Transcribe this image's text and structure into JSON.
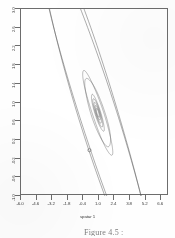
{
  "figure": {
    "caption": "Figure 4.5 :"
  },
  "chart_data": {
    "type": "line",
    "title": "",
    "subtitle": "",
    "xlabel": "spatar 1",
    "ylabel": "",
    "xlim": [
      -6.0,
      7.3
    ],
    "ylim": [
      -1.0,
      3.0
    ],
    "grid": false,
    "legend": null,
    "xticks": [
      "-6.0",
      "-4.6",
      "-3.2",
      "-1.8",
      "-0.4",
      "1.0",
      "2.4",
      "3.8",
      "5.2",
      "6.6"
    ],
    "xtick_values": [
      -6.0,
      -4.6,
      -3.2,
      -1.8,
      -0.4,
      1.0,
      2.4,
      3.8,
      5.2,
      6.6
    ],
    "yticks": [
      "3.0",
      "2.6",
      "2.2",
      "1.8",
      "1.4",
      "1.0",
      "0.6",
      "0.2",
      "-0.2",
      "-0.6",
      "-1.0"
    ],
    "ytick_values": [
      3.0,
      2.6,
      2.2,
      1.8,
      1.4,
      1.0,
      0.6,
      0.2,
      -0.2,
      -0.6,
      -1.0
    ],
    "center": {
      "x": 0.9,
      "y": 0.78
    },
    "marker": {
      "shape": "open-circle",
      "x": 0.15,
      "y": -0.02
    },
    "contours": [
      {
        "name": "outer-ellipse-a",
        "cx": 0.9,
        "cy": 0.78,
        "rx": 6.55,
        "ry": 1.02,
        "angle_deg": -35
      },
      {
        "name": "outer-ellipse-b",
        "cx": 0.9,
        "cy": 0.78,
        "rx": 6.45,
        "ry": 1.12,
        "angle_deg": -36
      },
      {
        "name": "mid-ellipse-a",
        "cx": 0.9,
        "cy": 0.78,
        "rx": 1.6,
        "ry": 0.3,
        "angle_deg": -33
      },
      {
        "name": "mid-ellipse-b",
        "cx": 0.9,
        "cy": 0.78,
        "rx": 1.32,
        "ry": 0.36,
        "angle_deg": -30
      },
      {
        "name": "inner-ellipse-a",
        "cx": 0.9,
        "cy": 0.78,
        "rx": 0.68,
        "ry": 0.16,
        "angle_deg": -33
      },
      {
        "name": "inner-ellipse-b",
        "cx": 0.9,
        "cy": 0.78,
        "rx": 0.52,
        "ry": 0.13,
        "angle_deg": -33
      },
      {
        "name": "inner-ellipse-c",
        "cx": 0.9,
        "cy": 0.78,
        "rx": 0.38,
        "ry": 0.1,
        "angle_deg": -33
      },
      {
        "name": "inner-ellipse-d",
        "cx": 0.9,
        "cy": 0.78,
        "rx": 0.26,
        "ry": 0.075,
        "angle_deg": -33
      },
      {
        "name": "inner-ellipse-e",
        "cx": 0.9,
        "cy": 0.78,
        "rx": 0.16,
        "ry": 0.05,
        "angle_deg": -33
      }
    ]
  },
  "style": {
    "line_color": "#555555",
    "axis_color": "#6d6d6d",
    "text_color": "#3a3a3a",
    "background": "#ffffff"
  }
}
